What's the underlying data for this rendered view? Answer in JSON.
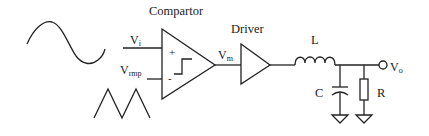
{
  "diagram": {
    "blocks": {
      "comparator": {
        "label": "Compartor",
        "plus": "+",
        "minus": "-"
      },
      "driver": {
        "label": "Driver"
      }
    },
    "signals": {
      "vi": {
        "main": "V",
        "sub": "i"
      },
      "vramp": {
        "main": "V",
        "sub": "rmp"
      },
      "vm": {
        "main": "V",
        "sub": "m"
      },
      "vo": {
        "main": "V",
        "sub": "o"
      }
    },
    "components": {
      "inductor": "L",
      "capacitor": "C",
      "resistor": "R"
    },
    "waveforms": [
      "sine-wave",
      "triangle-wave"
    ],
    "line_color": "#222222",
    "background": "#ffffff"
  }
}
